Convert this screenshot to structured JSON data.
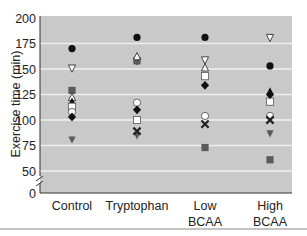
{
  "chart_data": {
    "type": "scatter",
    "title": "",
    "xlabel": "",
    "ylabel": "Exercise time (min)",
    "ylim": [
      0,
      200
    ],
    "axis_break": "between 0 and 50",
    "grid": true,
    "y_ticks": [
      "0",
      "50",
      "75",
      "100",
      "125",
      "150",
      "175",
      "200"
    ],
    "categories": [
      {
        "label_lines": [
          "Control"
        ]
      },
      {
        "label_lines": [
          "Tryptophan"
        ]
      },
      {
        "label_lines": [
          "Low",
          "BCAA"
        ]
      },
      {
        "label_lines": [
          "High",
          "BCAA"
        ]
      }
    ],
    "series": [
      {
        "name": "subject-filled-circle",
        "marker": "filled-circle",
        "values": [
          170,
          181,
          181,
          153
        ]
      },
      {
        "name": "subject-open-triangle-down",
        "marker": "open-triangle-down",
        "values": [
          151,
          158,
          159,
          181
        ]
      },
      {
        "name": "subject-grey-square",
        "marker": "grey-square",
        "values": [
          129,
          158,
          73,
          61
        ]
      },
      {
        "name": "subject-open-triangle-up",
        "marker": "open-triangle-up",
        "values": [
          122,
          162,
          151,
          null
        ]
      },
      {
        "name": "subject-filled-triangle-up",
        "marker": "filled-triangle-up",
        "values": [
          118,
          null,
          null,
          128
        ]
      },
      {
        "name": "subject-open-square",
        "marker": "open-square",
        "values": [
          113,
          100,
          143,
          118
        ]
      },
      {
        "name": "subject-open-circle",
        "marker": "open-circle",
        "values": [
          108,
          117,
          104,
          104
        ]
      },
      {
        "name": "subject-filled-diamond",
        "marker": "filled-diamond",
        "values": [
          103,
          110,
          134,
          125
        ]
      },
      {
        "name": "subject-grey-triangle-down",
        "marker": "grey-triangle-down",
        "values": [
          81,
          85,
          null,
          87
        ]
      },
      {
        "name": "subject-cross",
        "marker": "cross",
        "values": [
          null,
          89,
          96,
          100
        ]
      }
    ],
    "colors": {
      "plot_background": "#c9c9c9",
      "gridline": "#efefef",
      "marker_dark": "#111111",
      "marker_grey": "#5a5a5a",
      "marker_open_fill": "#ffffff"
    }
  }
}
